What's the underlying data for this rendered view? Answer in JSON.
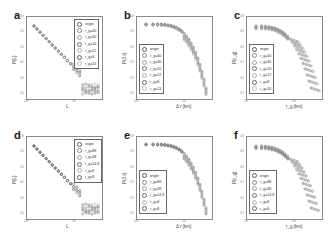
{
  "chart_data": [
    {
      "panel": "a",
      "type": "scatter",
      "xscale": "log",
      "yscale": "log",
      "xlabel": "L",
      "ylabel": "P(L)",
      "yticks": [
        "10^0",
        "10^-1",
        "10^-2",
        "10^-3",
        "10^-4",
        "10^-5"
      ],
      "xticks": [
        "10^0",
        "10^1"
      ],
      "legend_position": "upper right",
      "legend": [
        "origin",
        "r_g=40",
        "r_g=30",
        "r_g=16",
        "r_g=12",
        "r_g=8",
        "r_g=13"
      ],
      "trend": "power-law decay"
    },
    {
      "panel": "b",
      "type": "scatter",
      "xscale": "log",
      "yscale": "log",
      "xlabel": "Δr [km]",
      "ylabel": "P(Δr)",
      "yticks": [
        "10^0",
        "10^-1",
        "10^-2",
        "10^-3",
        "10^-4",
        "10^-5"
      ],
      "xticks": [
        "10^0",
        "10^1"
      ],
      "legend_position": "lower left",
      "legend": [
        "origin",
        "r_g=40",
        "r_g=30",
        "r_g=16",
        "r_g=12",
        "r_g=8",
        "r_g=13"
      ],
      "trend": "flat then cutoff"
    },
    {
      "panel": "c",
      "type": "scatter",
      "xscale": "log",
      "yscale": "log",
      "xlabel": "r_g [km]",
      "ylabel": "P(r_g)",
      "yticks": [
        "10^0",
        "10^-1",
        "10^-2",
        "10^-3",
        "10^-4",
        "10^-5"
      ],
      "xticks": [
        "10^0",
        "10^1"
      ],
      "legend_position": "lower left",
      "legend": [
        "origin",
        "r_g=40",
        "r_g=30",
        "r_g=16",
        "r_g=12",
        "r_g=8",
        "r_g=16"
      ],
      "trend": "decay with cutoff"
    },
    {
      "panel": "d",
      "type": "scatter",
      "xscale": "log",
      "yscale": "log",
      "xlabel": "L",
      "ylabel": "P(L)",
      "yticks": [
        "10^0",
        "10^-1",
        "10^-2",
        "10^-3",
        "10^-4",
        "10^-5"
      ],
      "xticks": [
        "10^0",
        "10^1"
      ],
      "legend_position": "upper right",
      "legend": [
        "origin",
        "r_g=88",
        "r_g=38",
        "r_g=14.8",
        "r_g=8",
        "r_g=8"
      ],
      "trend": "power-law decay"
    },
    {
      "panel": "e",
      "type": "scatter",
      "xscale": "log",
      "yscale": "log",
      "xlabel": "Δr [km]",
      "ylabel": "P(Δr)",
      "yticks": [
        "10^0",
        "10^-1",
        "10^-2",
        "10^-3",
        "10^-4",
        "10^-5"
      ],
      "xticks": [
        "10^0",
        "10^1"
      ],
      "legend_position": "lower left",
      "legend": [
        "origin",
        "r_g=88",
        "r_g=38",
        "r_g=14.8",
        "r_g=8",
        "r_g=8"
      ],
      "trend": "flat then cutoff"
    },
    {
      "panel": "f",
      "type": "scatter",
      "xscale": "log",
      "yscale": "log",
      "xlabel": "r_g [km]",
      "ylabel": "P(r_g)",
      "yticks": [
        "10^0",
        "10^-1",
        "10^-2",
        "10^-3",
        "10^-4",
        "10^-5"
      ],
      "xticks": [
        "10^0",
        "10^1"
      ],
      "legend_position": "lower left",
      "legend": [
        "origin",
        "r_g=88",
        "r_g=38",
        "r_g=14.8",
        "r_g=8",
        "r_g=8"
      ],
      "trend": "decay with cutoff"
    }
  ],
  "panels": {
    "a": {
      "letter": "a",
      "xlabel": "L",
      "ylabel": "P(L)",
      "xtick0": "10⁰",
      "xtick1": "10¹",
      "legend": [
        "origin",
        "r_g=40",
        "r_g=30",
        "r_g=16",
        "r_g=12",
        "r_g=8",
        "r_g=13"
      ]
    },
    "b": {
      "letter": "b",
      "xlabel": "Δ r [km]",
      "ylabel": "P(Δ r)",
      "xtick0": "10⁰",
      "xtick1": "10¹",
      "legend": [
        "origin",
        "r_g=40",
        "r_g=30",
        "r_g=16",
        "r_g=12",
        "r_g=8",
        "r_g=13"
      ]
    },
    "c": {
      "letter": "c",
      "xlabel": "r_g [km]",
      "ylabel": "P(r_g)",
      "xtick0": "10⁰",
      "xtick1": "10¹",
      "legend": [
        "origin",
        "r_g=40",
        "r_g=30",
        "r_g=16",
        "r_g=12",
        "r_g=8",
        "r_g=16"
      ]
    },
    "d": {
      "letter": "d",
      "xlabel": "L",
      "ylabel": "P(L)",
      "xtick0": "10⁰",
      "xtick1": "10¹",
      "legend": [
        "origin",
        "r_g=88",
        "r_g=38",
        "r_g=14.8",
        "r_g=8",
        "r_g=8"
      ]
    },
    "e": {
      "letter": "e",
      "xlabel": "Δ r [km]",
      "ylabel": "P(Δ r)",
      "xtick0": "10⁰",
      "xtick1": "10¹",
      "legend": [
        "origin",
        "r_g=88",
        "r_g=38",
        "r_g=14.8",
        "r_g=8",
        "r_g=8"
      ]
    },
    "f": {
      "letter": "f",
      "xlabel": "r_g [km]",
      "ylabel": "P(r_g)",
      "xtick0": "10⁰",
      "xtick1": "10¹",
      "legend": [
        "origin",
        "r_g=88",
        "r_g=38",
        "r_g=14.8",
        "r_g=8",
        "r_g=8"
      ]
    }
  },
  "yticks": [
    "10⁰",
    "10⁻¹",
    "10⁻²",
    "10⁻³",
    "10⁻⁴",
    "10⁻⁵"
  ],
  "colors": {
    "markers": [
      "#5a5a5a",
      "#8a8a8a",
      "#a0a0a0",
      "#707070",
      "#b0b0b0",
      "#606060",
      "#c0c0c0"
    ],
    "frame": "#8a8a8a"
  }
}
